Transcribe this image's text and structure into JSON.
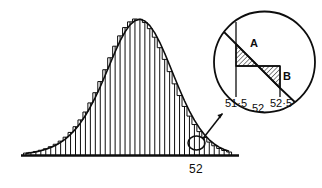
{
  "figure": {
    "name": "normal-curve-histogram-with-magnified-detail",
    "background_color": "#ffffff",
    "ink_color": "#0d0d0d",
    "main_axis_label": "52",
    "detail": {
      "tick_labels": [
        "51·5",
        "52",
        "52·5"
      ],
      "tick_left": "51·5",
      "tick_middle": "52",
      "tick_right": "52·5",
      "region_a_label": "A",
      "region_b_label": "B",
      "hatch_pattern": "diagonal-hatch"
    }
  },
  "chart_data": {
    "type": "bar",
    "title": "",
    "subtitle": "",
    "xlabel": "",
    "ylabel": "",
    "grid": false,
    "legend": "none",
    "annotations": [
      {
        "text": "52",
        "role": "x-axis-tick-main",
        "x": 52
      },
      {
        "text": "A",
        "role": "hatched-region-above-bar-left-of-52",
        "note": "excess area of curve over histogram block between 51·5 and 52"
      },
      {
        "text": "B",
        "role": "hatched-region-below-bar-right-of-52",
        "note": "deficit area of histogram block over curve between 52 and 52·5"
      },
      {
        "text": "51·5",
        "role": "detail-tick-left",
        "x": 51.5
      },
      {
        "text": "52",
        "role": "detail-tick-middle",
        "x": 52
      },
      {
        "text": "52·5",
        "role": "detail-tick-right",
        "x": 52.5
      }
    ],
    "xlim": [
      44.0,
      55.0
    ],
    "ylim": [
      0,
      1.0
    ],
    "bar_width": 0.25,
    "overlay_curve": "normal density",
    "categories": [
      44.25,
      44.5,
      44.75,
      45.0,
      45.25,
      45.5,
      45.75,
      46.0,
      46.25,
      46.5,
      46.75,
      47.0,
      47.25,
      47.5,
      47.75,
      48.0,
      48.25,
      48.5,
      48.75,
      49.0,
      49.25,
      49.5,
      49.75,
      50.0,
      50.25,
      50.5,
      50.75,
      51.0,
      51.25,
      51.5,
      51.75,
      52.0,
      52.25,
      52.5,
      52.75,
      53.0,
      53.25,
      53.5,
      53.75,
      54.0,
      54.25,
      54.5
    ],
    "values": [
      0.014,
      0.019,
      0.026,
      0.035,
      0.046,
      0.061,
      0.079,
      0.102,
      0.131,
      0.166,
      0.208,
      0.258,
      0.316,
      0.383,
      0.458,
      0.54,
      0.627,
      0.715,
      0.8,
      0.876,
      0.937,
      0.979,
      1.0,
      0.998,
      0.974,
      0.929,
      0.866,
      0.789,
      0.703,
      0.613,
      0.523,
      0.437,
      0.357,
      0.286,
      0.224,
      0.172,
      0.129,
      0.095,
      0.068,
      0.048,
      0.033,
      0.022
    ],
    "series": [
      {
        "name": "histogram",
        "values": [
          0.014,
          0.019,
          0.026,
          0.035,
          0.046,
          0.061,
          0.079,
          0.102,
          0.131,
          0.166,
          0.208,
          0.258,
          0.316,
          0.383,
          0.458,
          0.54,
          0.627,
          0.715,
          0.8,
          0.876,
          0.937,
          0.979,
          1.0,
          0.998,
          0.974,
          0.929,
          0.866,
          0.789,
          0.703,
          0.613,
          0.523,
          0.437,
          0.357,
          0.286,
          0.224,
          0.172,
          0.129,
          0.095,
          0.068,
          0.048,
          0.033,
          0.022
        ]
      },
      {
        "name": "normal-curve",
        "values": [
          0.012,
          0.017,
          0.023,
          0.031,
          0.042,
          0.055,
          0.072,
          0.093,
          0.119,
          0.151,
          0.19,
          0.236,
          0.29,
          0.353,
          0.424,
          0.502,
          0.586,
          0.673,
          0.759,
          0.839,
          0.906,
          0.957,
          0.988,
          0.998,
          0.985,
          0.951,
          0.898,
          0.829,
          0.748,
          0.66,
          0.57,
          0.482,
          0.399,
          0.323,
          0.256,
          0.199,
          0.151,
          0.112,
          0.081,
          0.058,
          0.04,
          0.027
        ]
      }
    ]
  }
}
